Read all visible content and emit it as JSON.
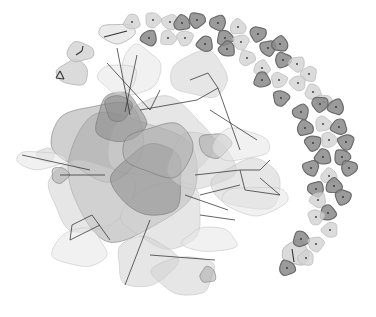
{
  "diagram": {
    "type": "network-graph",
    "width": 376,
    "height": 317,
    "background": "#ffffff",
    "colors": {
      "dark": "#8a8a8a",
      "mid": "#a9a9a9",
      "light": "#d2d2d2",
      "pale": "#e6e6e6",
      "stroke_dark": "#6b6b6b",
      "stroke_light": "#bdbdbd",
      "edge": "#333333",
      "dot": "#333333"
    },
    "singleton_arc": [
      {
        "x": 132,
        "y": 22,
        "s": "light"
      },
      {
        "x": 153,
        "y": 20,
        "s": "light"
      },
      {
        "x": 170,
        "y": 22,
        "s": "light"
      },
      {
        "x": 182,
        "y": 23,
        "s": "dark"
      },
      {
        "x": 197,
        "y": 20,
        "s": "dark"
      },
      {
        "x": 218,
        "y": 23,
        "s": "dark"
      },
      {
        "x": 238,
        "y": 27,
        "s": "light"
      },
      {
        "x": 258,
        "y": 34,
        "s": "dark"
      },
      {
        "x": 149,
        "y": 38,
        "s": "dark"
      },
      {
        "x": 168,
        "y": 38,
        "s": "light"
      },
      {
        "x": 185,
        "y": 38,
        "s": "light"
      },
      {
        "x": 205,
        "y": 44,
        "s": "dark"
      },
      {
        "x": 225,
        "y": 38,
        "s": "dark"
      },
      {
        "x": 241,
        "y": 42,
        "s": "light"
      },
      {
        "x": 227,
        "y": 49,
        "s": "dark"
      },
      {
        "x": 247,
        "y": 58,
        "s": "light"
      },
      {
        "x": 268,
        "y": 48,
        "s": "dark"
      },
      {
        "x": 280,
        "y": 44,
        "s": "dark"
      },
      {
        "x": 283,
        "y": 60,
        "s": "dark"
      },
      {
        "x": 297,
        "y": 64,
        "s": "light"
      },
      {
        "x": 262,
        "y": 68,
        "s": "light"
      },
      {
        "x": 279,
        "y": 80,
        "s": "light"
      },
      {
        "x": 298,
        "y": 83,
        "s": "light"
      },
      {
        "x": 262,
        "y": 80,
        "s": "dark"
      },
      {
        "x": 281,
        "y": 98,
        "s": "dark"
      },
      {
        "x": 309,
        "y": 74,
        "s": "light"
      },
      {
        "x": 313,
        "y": 92,
        "s": "light"
      },
      {
        "x": 324,
        "y": 102,
        "s": "light"
      },
      {
        "x": 301,
        "y": 112,
        "s": "dark"
      },
      {
        "x": 305,
        "y": 128,
        "s": "dark"
      },
      {
        "x": 320,
        "y": 104,
        "s": "dark"
      },
      {
        "x": 336,
        "y": 107,
        "s": "dark"
      },
      {
        "x": 323,
        "y": 124,
        "s": "light"
      },
      {
        "x": 313,
        "y": 143,
        "s": "dark"
      },
      {
        "x": 339,
        "y": 127,
        "s": "dark"
      },
      {
        "x": 329,
        "y": 140,
        "s": "light"
      },
      {
        "x": 346,
        "y": 142,
        "s": "dark"
      },
      {
        "x": 323,
        "y": 157,
        "s": "dark"
      },
      {
        "x": 342,
        "y": 157,
        "s": "dark"
      },
      {
        "x": 311,
        "y": 168,
        "s": "dark"
      },
      {
        "x": 329,
        "y": 176,
        "s": "light"
      },
      {
        "x": 349,
        "y": 168,
        "s": "dark"
      },
      {
        "x": 316,
        "y": 189,
        "s": "dark"
      },
      {
        "x": 334,
        "y": 186,
        "s": "dark"
      },
      {
        "x": 343,
        "y": 197,
        "s": "dark"
      },
      {
        "x": 318,
        "y": 200,
        "s": "light"
      },
      {
        "x": 328,
        "y": 213,
        "s": "dark"
      },
      {
        "x": 316,
        "y": 217,
        "s": "light"
      },
      {
        "x": 330,
        "y": 230,
        "s": "light"
      },
      {
        "x": 301,
        "y": 239,
        "s": "dark"
      },
      {
        "x": 316,
        "y": 244,
        "s": "light"
      },
      {
        "x": 306,
        "y": 258,
        "s": "light"
      },
      {
        "x": 287,
        "y": 268,
        "s": "dark"
      }
    ],
    "small_components": [
      {
        "cx": 73,
        "cy": 73,
        "rx": 18,
        "ry": 14,
        "s": "light",
        "edges": [
          [
            56,
            78,
            60,
            71
          ],
          [
            60,
            71,
            64,
            79
          ],
          [
            64,
            79,
            56,
            78
          ]
        ]
      },
      {
        "cx": 80,
        "cy": 52,
        "rx": 15,
        "ry": 11,
        "s": "light",
        "edges": [
          [
            76,
            55,
            82,
            51
          ],
          [
            82,
            51,
            83,
            46
          ]
        ]
      },
      {
        "cx": 117,
        "cy": 33,
        "rx": 21,
        "ry": 11,
        "s": "pale",
        "edges": [
          [
            104,
            37,
            127,
            31
          ]
        ]
      },
      {
        "cx": 296,
        "cy": 253,
        "rx": 15,
        "ry": 14,
        "s": "light",
        "edges": [
          [
            292,
            249,
            294,
            262
          ]
        ]
      }
    ],
    "cluster_blobs": [
      {
        "cx": 130,
        "cy": 175,
        "rx": 75,
        "ry": 70,
        "s": "mid"
      },
      {
        "cx": 100,
        "cy": 140,
        "rx": 52,
        "ry": 44,
        "s": "mid"
      },
      {
        "cx": 160,
        "cy": 140,
        "rx": 60,
        "ry": 45,
        "s": "light"
      },
      {
        "cx": 90,
        "cy": 195,
        "rx": 48,
        "ry": 40,
        "s": "light"
      },
      {
        "cx": 165,
        "cy": 215,
        "rx": 45,
        "ry": 38,
        "s": "light"
      },
      {
        "cx": 120,
        "cy": 118,
        "rx": 28,
        "ry": 28,
        "s": "dark"
      },
      {
        "cx": 118,
        "cy": 108,
        "rx": 15,
        "ry": 15,
        "s": "dark"
      },
      {
        "cx": 150,
        "cy": 180,
        "rx": 40,
        "ry": 40,
        "s": "dark"
      },
      {
        "cx": 200,
        "cy": 162,
        "rx": 38,
        "ry": 32,
        "s": "light"
      },
      {
        "cx": 215,
        "cy": 145,
        "rx": 18,
        "ry": 14,
        "s": "mid"
      },
      {
        "cx": 248,
        "cy": 185,
        "rx": 40,
        "ry": 28,
        "s": "light"
      },
      {
        "cx": 240,
        "cy": 145,
        "rx": 32,
        "ry": 18,
        "s": "pale"
      },
      {
        "cx": 255,
        "cy": 200,
        "rx": 38,
        "ry": 16,
        "s": "pale"
      },
      {
        "cx": 200,
        "cy": 75,
        "rx": 32,
        "ry": 26,
        "s": "light"
      },
      {
        "cx": 140,
        "cy": 70,
        "rx": 22,
        "ry": 28,
        "s": "pale"
      },
      {
        "cx": 118,
        "cy": 78,
        "rx": 22,
        "ry": 16,
        "s": "pale"
      },
      {
        "cx": 80,
        "cy": 248,
        "rx": 30,
        "ry": 22,
        "s": "pale"
      },
      {
        "cx": 145,
        "cy": 262,
        "rx": 34,
        "ry": 28,
        "s": "light"
      },
      {
        "cx": 185,
        "cy": 275,
        "rx": 35,
        "ry": 22,
        "s": "light"
      },
      {
        "cx": 210,
        "cy": 240,
        "rx": 30,
        "ry": 14,
        "s": "pale"
      },
      {
        "cx": 60,
        "cy": 175,
        "rx": 10,
        "ry": 9,
        "s": "mid"
      },
      {
        "cx": 46,
        "cy": 155,
        "rx": 10,
        "ry": 8,
        "s": "light"
      },
      {
        "cx": 208,
        "cy": 275,
        "rx": 9,
        "ry": 9,
        "s": "mid"
      },
      {
        "cx": 40,
        "cy": 160,
        "rx": 28,
        "ry": 10,
        "s": "pale"
      },
      {
        "cx": 160,
        "cy": 150,
        "rx": 40,
        "ry": 30,
        "s": "mid"
      }
    ],
    "cluster_edges": {
      "hub": {
        "cx": 135,
        "cy": 175
      },
      "count": 180,
      "seed": 7,
      "radius": 85
    },
    "explicit_edges": [
      [
        117,
        48,
        130,
        115
      ],
      [
        137,
        55,
        125,
        112
      ],
      [
        107,
        63,
        150,
        110
      ],
      [
        150,
        110,
        160,
        90
      ],
      [
        140,
        110,
        197,
        100
      ],
      [
        197,
        100,
        218,
        88
      ],
      [
        218,
        88,
        208,
        73
      ],
      [
        208,
        73,
        190,
        80
      ],
      [
        218,
        88,
        240,
        150
      ],
      [
        22,
        155,
        90,
        170
      ],
      [
        60,
        175,
        105,
        175
      ],
      [
        70,
        240,
        100,
        225
      ],
      [
        70,
        240,
        72,
        225
      ],
      [
        72,
        225,
        92,
        215
      ],
      [
        92,
        215,
        110,
        240
      ],
      [
        125,
        285,
        150,
        220
      ],
      [
        195,
        175,
        240,
        170
      ],
      [
        240,
        170,
        260,
        170
      ],
      [
        260,
        170,
        270,
        160
      ],
      [
        240,
        170,
        245,
        190
      ],
      [
        245,
        190,
        280,
        195
      ],
      [
        280,
        195,
        260,
        178
      ],
      [
        200,
        195,
        240,
        185
      ],
      [
        210,
        110,
        257,
        140
      ],
      [
        150,
        255,
        215,
        260
      ],
      [
        200,
        215,
        235,
        220
      ],
      [
        185,
        195,
        228,
        210
      ]
    ]
  }
}
